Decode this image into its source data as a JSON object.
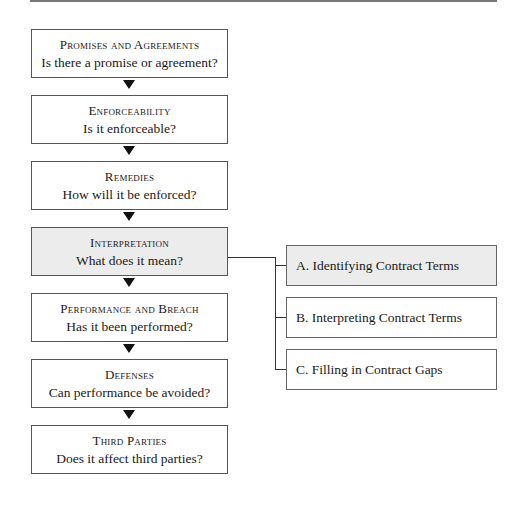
{
  "diagram": {
    "main_steps": [
      {
        "title": "Promises and Agreements",
        "question": "Is there a promise or agreement?",
        "highlighted": false
      },
      {
        "title": "Enforceability",
        "question": "Is it enforceable?",
        "highlighted": false
      },
      {
        "title": "Remedies",
        "question": "How will it be enforced?",
        "highlighted": false
      },
      {
        "title": "Interpretation",
        "question": "What does it mean?",
        "highlighted": true
      },
      {
        "title": "Performance and Breach",
        "question": "Has it been performed?",
        "highlighted": false
      },
      {
        "title": "Defenses",
        "question": "Can performance be avoided?",
        "highlighted": false
      },
      {
        "title": "Third Parties",
        "question": "Does it affect third parties?",
        "highlighted": false
      }
    ],
    "sub_steps": [
      {
        "label": "A.  Identifying Contract Terms",
        "highlighted": true
      },
      {
        "label": "B.  Interpreting Contract Terms",
        "highlighted": false
      },
      {
        "label": "C.  Filling in Contract Gaps",
        "highlighted": false
      }
    ],
    "colors": {
      "highlight": "#ececec",
      "border": "#555555",
      "arrow": "#111111"
    }
  }
}
